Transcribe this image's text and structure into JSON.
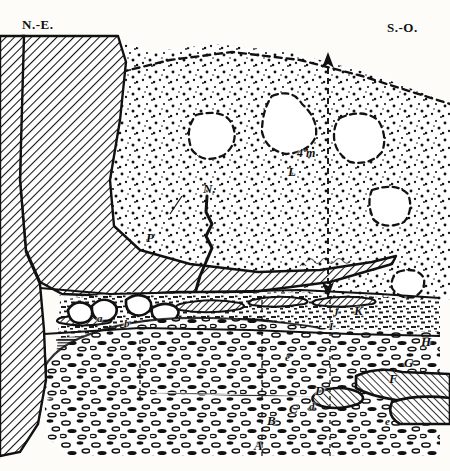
{
  "figure": {
    "type": "geological-cross-section",
    "background_color": "#fdfcf9",
    "ink_color": "#111111"
  },
  "compass": {
    "left_label": "N.-E.",
    "right_label": "S.-O."
  },
  "dimension": {
    "label": "4 m",
    "orientation": "vertical",
    "style": "dashed-arrow"
  },
  "labels": [
    {
      "id": "L",
      "text": "L",
      "x": 288,
      "y": 164,
      "size": "cap"
    },
    {
      "id": "N",
      "text": "N.",
      "x": 203,
      "y": 193,
      "size": "cap"
    },
    {
      "id": "P",
      "text": "P",
      "x": 148,
      "y": 244,
      "size": "cap"
    },
    {
      "id": "K",
      "text": "K",
      "x": 355,
      "y": 315,
      "size": "cap"
    },
    {
      "id": "J",
      "text": "J",
      "x": 333,
      "y": 315,
      "size": "small"
    },
    {
      "id": "I",
      "text": "I",
      "x": 329,
      "y": 329,
      "size": "small"
    },
    {
      "id": "H",
      "text": "H",
      "x": 422,
      "y": 345,
      "size": "cap"
    },
    {
      "id": "G",
      "text": "G",
      "x": 405,
      "y": 365,
      "size": "cap"
    },
    {
      "id": "F2",
      "text": "F",
      "x": 390,
      "y": 381,
      "size": "cap"
    },
    {
      "id": "E",
      "text": "e",
      "x": 285,
      "y": 360,
      "size": "small"
    },
    {
      "id": "D",
      "text": "D",
      "x": 316,
      "y": 394,
      "size": "cap"
    },
    {
      "id": "Dm",
      "text": "d",
      "x": 310,
      "y": 410,
      "size": "small"
    },
    {
      "id": "C",
      "text": "C",
      "x": 290,
      "y": 412,
      "size": "cap"
    },
    {
      "id": "B",
      "text": "B",
      "x": 268,
      "y": 424,
      "size": "cap"
    },
    {
      "id": "A",
      "text": "A",
      "x": 255,
      "y": 449,
      "size": "cap"
    },
    {
      "id": "E2",
      "text": "e",
      "x": 385,
      "y": 425,
      "size": "small"
    },
    {
      "id": "a1",
      "text": "a",
      "x": 98,
      "y": 321,
      "size": "small"
    },
    {
      "id": "b1",
      "text": "b",
      "x": 124,
      "y": 326,
      "size": "small"
    }
  ],
  "units": {
    "bedrock_hatched": {
      "name": "hatched-bedrock",
      "description": "diagonal-hatched massif",
      "fill": "#ffffff",
      "stroke": "#111111"
    },
    "stipple_fill": {
      "name": "stippled-infill",
      "description": "dotted sediment fill with dashed block outlines",
      "fill": "#ffffff"
    },
    "gravel_bed": {
      "name": "gravel-pebble-bed",
      "description": "rounded pebble clast bed",
      "fill": "#ffffff"
    }
  }
}
